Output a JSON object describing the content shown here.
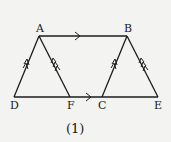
{
  "figure": {
    "caption": "(1)",
    "points": {
      "A": {
        "label": "A",
        "x": 39,
        "y": 36
      },
      "B": {
        "label": "B",
        "x": 127,
        "y": 36
      },
      "D": {
        "label": "D",
        "x": 14,
        "y": 97
      },
      "F": {
        "label": "F",
        "x": 70,
        "y": 97
      },
      "C": {
        "label": "C",
        "x": 102,
        "y": 97
      },
      "E": {
        "label": "E",
        "x": 158,
        "y": 97
      }
    },
    "segments": [
      {
        "from": "A",
        "to": "B",
        "arrows": 1
      },
      {
        "from": "D",
        "to": "E",
        "arrows": 1
      },
      {
        "from": "D",
        "to": "A",
        "arrows": 2
      },
      {
        "from": "C",
        "to": "B",
        "arrows": 2
      },
      {
        "from": "F",
        "to": "A",
        "arrows": 3
      },
      {
        "from": "E",
        "to": "B",
        "arrows": 3
      }
    ],
    "colors": {
      "line": "#1c1c1c",
      "background": "#f3f3f1"
    }
  }
}
